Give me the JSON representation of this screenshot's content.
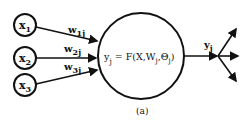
{
  "diagram": {
    "type": "neuron-model",
    "caption": "(a)",
    "inputs": [
      {
        "label": "x",
        "sub": "1"
      },
      {
        "label": "x",
        "sub": "2"
      },
      {
        "label": "x",
        "sub": "3"
      }
    ],
    "weights": [
      {
        "label": "w",
        "sub": "1j"
      },
      {
        "label": "w",
        "sub": "2j"
      },
      {
        "label": "w",
        "sub": "3j"
      }
    ],
    "neuron": {
      "lhs": "y",
      "lhs_sub": "j",
      "eq": " = F(X,W",
      "w_sub": "j",
      "mid": ",Θ",
      "theta_sub": "j",
      "close": ")"
    },
    "output": {
      "label": "y",
      "sub": "j"
    },
    "colors": {
      "stroke": "#111111",
      "background": "#ffffff"
    }
  }
}
